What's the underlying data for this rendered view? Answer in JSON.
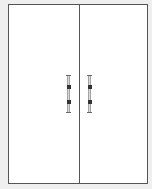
{
  "diagram": {
    "type": "double-door-cabinet-elevation",
    "colors": {
      "background": "#efefef",
      "panel": "#ffffff",
      "outline": "#555555",
      "handle": "#8a8a8a",
      "handle_band": "#333333"
    },
    "doors": [
      {
        "side": "left",
        "handle": "bar-handle"
      },
      {
        "side": "right",
        "handle": "bar-handle"
      }
    ]
  }
}
